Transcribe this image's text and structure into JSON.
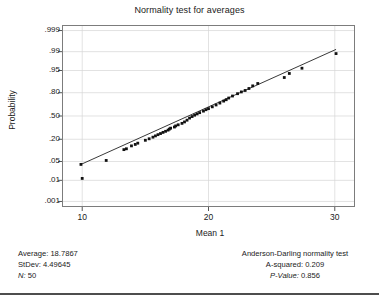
{
  "chart_data": {
    "type": "scatter",
    "title": "Normality test for averages",
    "xlabel": "Mean 1",
    "ylabel": "Probability",
    "grid": true,
    "legend": "none",
    "xlim": [
      8.4,
      31.6
    ],
    "ylim_probability": [
      0.0005,
      0.9995
    ],
    "xticks": [
      "10",
      "20",
      "30"
    ],
    "xtick_values": [
      10,
      20,
      30
    ],
    "yticks": [
      ".999",
      ".99",
      ".95",
      ".80",
      ".50",
      ".20",
      ".05",
      ".01",
      ".001"
    ],
    "ytick_values": [
      0.999,
      0.99,
      0.95,
      0.8,
      0.5,
      0.2,
      0.05,
      0.01,
      0.001
    ],
    "point_color": "#111111",
    "line_color": "#222222",
    "n_points": 50,
    "x": [
      9.9,
      10.0,
      11.9,
      13.3,
      13.5,
      13.9,
      14.2,
      14.4,
      15.0,
      15.3,
      15.6,
      15.8,
      16.0,
      16.2,
      16.4,
      16.6,
      16.8,
      16.9,
      17.0,
      17.3,
      17.4,
      17.6,
      17.9,
      18.1,
      18.3,
      18.5,
      18.7,
      18.9,
      19.1,
      19.3,
      19.6,
      19.8,
      20.0,
      20.3,
      20.6,
      20.9,
      21.2,
      21.4,
      21.6,
      21.9,
      22.3,
      22.6,
      22.9,
      23.2,
      23.5,
      23.9,
      26.0,
      26.4,
      27.4,
      30.1
    ],
    "probability": [
      0.04,
      0.012,
      0.054,
      0.112,
      0.118,
      0.14,
      0.152,
      0.163,
      0.19,
      0.205,
      0.222,
      0.236,
      0.25,
      0.263,
      0.277,
      0.29,
      0.305,
      0.318,
      0.33,
      0.345,
      0.36,
      0.375,
      0.395,
      0.415,
      0.44,
      0.47,
      0.492,
      0.512,
      0.53,
      0.548,
      0.57,
      0.59,
      0.605,
      0.63,
      0.655,
      0.68,
      0.705,
      0.722,
      0.742,
      0.765,
      0.79,
      0.808,
      0.822,
      0.84,
      0.862,
      0.88,
      0.918,
      0.938,
      0.958,
      0.988
    ],
    "fit_line": {
      "x_start": 9.9,
      "x_end": 30.1,
      "probability_start": 0.04,
      "probability_end": 0.992
    }
  },
  "footer": {
    "left": {
      "average_label": "Average:",
      "average_value": "18.7867",
      "stdev_label": "StDev:",
      "stdev_value": "4.49645",
      "n_label": "N:",
      "n_value": "50"
    },
    "right": {
      "test_name": "Anderson-Darling normality test",
      "a_squared_label": "A-squared:",
      "a_squared_value": "0.209",
      "p_value_label": "P-Value:",
      "p_value_value": "0.856"
    }
  }
}
